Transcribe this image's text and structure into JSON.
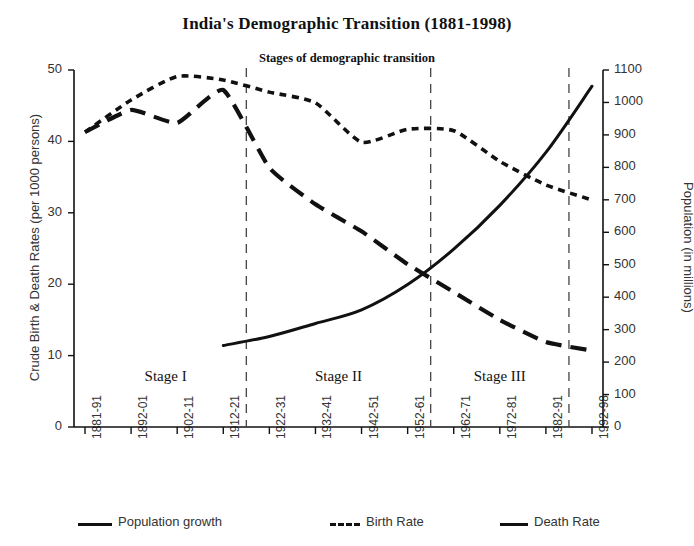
{
  "chart_data": {
    "type": "line",
    "title": "India's Demographic Transition (1881-1998)",
    "subtitle": "Stages of demographic transition",
    "xlabel": "",
    "ylabel": "Crude Birth & Death Rates (per 1000 persons)",
    "ylabel_right": "Population (in millions)",
    "grid": false,
    "legend_position": "bottom",
    "categories": [
      "1881-91",
      "1892-01",
      "1902-11",
      "1912-21",
      "1922-31",
      "1932-41",
      "1942-51",
      "1952-61",
      "1962-71",
      "1972-81",
      "1982-91",
      "1992-98"
    ],
    "ylim": [
      0,
      50
    ],
    "yticks": [
      0,
      10,
      20,
      30,
      40,
      50
    ],
    "ylim_right": [
      0,
      1100
    ],
    "yticks_right": [
      0,
      100,
      200,
      300,
      400,
      500,
      600,
      700,
      800,
      900,
      1000,
      1100
    ],
    "series": [
      {
        "name": "Birth Rate",
        "axis": "left",
        "style": "dotted",
        "values": [
          41.3,
          45.8,
          49.1,
          48.6,
          46.9,
          45.4,
          39.9,
          41.7,
          41.5,
          37.2,
          33.9,
          31.8
        ]
      },
      {
        "name": "Death Rate",
        "axis": "left",
        "style": "dashed",
        "values": [
          41.3,
          44.4,
          42.6,
          47.2,
          36.3,
          31.2,
          27.4,
          22.8,
          18.9,
          15.0,
          11.9,
          10.7
        ]
      },
      {
        "name": "Population growth",
        "axis": "right",
        "style": "solid",
        "values": [
          null,
          null,
          null,
          251,
          279,
          319,
          361,
          439,
          548,
          683,
          846,
          1050
        ]
      }
    ],
    "annotations": [
      {
        "label": "Stage I",
        "from": "1881-91",
        "to": "1912-21"
      },
      {
        "label": "Stage II",
        "from": "1912-21",
        "to": "1952-61"
      },
      {
        "label": "Stage III",
        "from": "1952-61",
        "to": "1982-91"
      }
    ],
    "dividers": [
      "1915",
      "1957",
      "1984"
    ]
  },
  "legend": {
    "items": [
      {
        "label": "Population growth",
        "style": "solid"
      },
      {
        "label": "Birth Rate",
        "style": "dotted"
      },
      {
        "label": "Death Rate",
        "style": "dashed"
      }
    ]
  }
}
